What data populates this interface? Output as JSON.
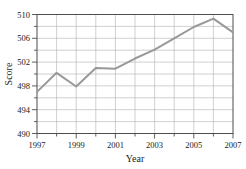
{
  "chart_data": {
    "type": "line",
    "title": "",
    "xlabel": "Year",
    "ylabel": "Score",
    "x": [
      1997,
      1998,
      1999,
      2000,
      2001,
      2002,
      2003,
      2004,
      2005,
      2006,
      2007
    ],
    "values": [
      497.0,
      500.2,
      497.9,
      501.0,
      500.9,
      502.6,
      504.1,
      506.0,
      507.9,
      509.3,
      507.0
    ],
    "series": [
      {
        "name": "Score",
        "values": [
          497.0,
          500.2,
          497.9,
          501.0,
          500.9,
          502.6,
          504.1,
          506.0,
          507.9,
          509.3,
          507.0
        ]
      }
    ],
    "xlim": [
      1997,
      2007
    ],
    "ylim": [
      490,
      510
    ],
    "x_tick_labels": [
      "1997",
      "1999",
      "2001",
      "2003",
      "2005",
      "2007"
    ],
    "x_tick_values": [
      1997,
      1999,
      2001,
      2003,
      2005,
      2007
    ],
    "x_minor_tick_values": [
      1998,
      2000,
      2002,
      2004,
      2006
    ],
    "y_tick_labels": [
      "490",
      "494",
      "498",
      "502",
      "506",
      "510"
    ],
    "y_tick_values": [
      490,
      494,
      498,
      502,
      506,
      510
    ],
    "y_gridline_values": [
      490,
      492,
      494,
      496,
      498,
      500,
      502,
      504,
      506,
      508,
      510
    ],
    "grid": true,
    "legend": "none",
    "line_color": "#999999",
    "grid_color": "#b0b0b0",
    "frame_color": "#4d4d4d"
  }
}
